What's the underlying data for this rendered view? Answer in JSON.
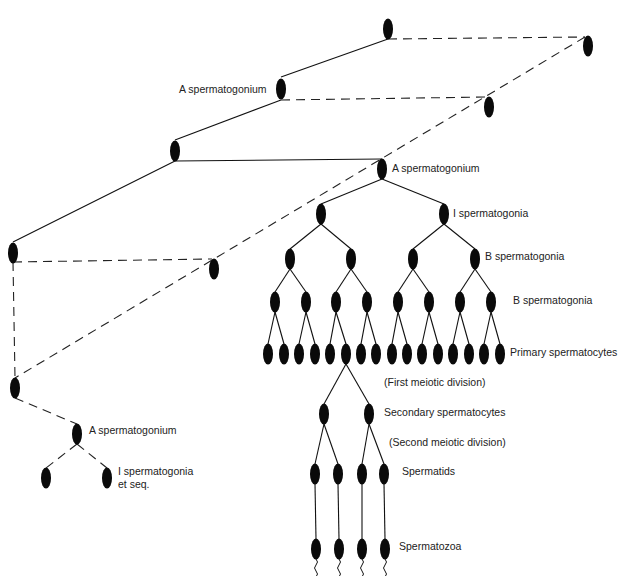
{
  "diagram": {
    "type": "cell-lineage-tree",
    "colors": {
      "background": "#ffffff",
      "ink": "#111111",
      "text": "#222222"
    },
    "labels": [
      {
        "id": "lbl-a-sperm-1",
        "text": "A spermatogonium",
        "x": 179,
        "y": 93
      },
      {
        "id": "lbl-a-sperm-2",
        "text": "A spermatogonium",
        "x": 392,
        "y": 172
      },
      {
        "id": "lbl-i-sperm",
        "text": "I spermatogonia",
        "x": 453,
        "y": 217
      },
      {
        "id": "lbl-b-sperm-1",
        "text": "B spermatogonia",
        "x": 485,
        "y": 260
      },
      {
        "id": "lbl-b-sperm-2",
        "text": "B spermatogonia",
        "x": 513,
        "y": 304
      },
      {
        "id": "lbl-primary",
        "text": "Primary spermatocytes",
        "x": 510,
        "y": 356
      },
      {
        "id": "lbl-first-meiotic",
        "text": "(First meiotic division)",
        "x": 384,
        "y": 386
      },
      {
        "id": "lbl-secondary",
        "text": "Secondary spermatocytes",
        "x": 384,
        "y": 416
      },
      {
        "id": "lbl-second-meiotic",
        "text": "(Second meiotic division)",
        "x": 389,
        "y": 446
      },
      {
        "id": "lbl-spermatids",
        "text": "Spermatids",
        "x": 402,
        "y": 475
      },
      {
        "id": "lbl-spermatozoa",
        "text": "Spermatozoa",
        "x": 399,
        "y": 550
      },
      {
        "id": "lbl-a-sperm-3",
        "text": "A spermatogonium",
        "x": 89,
        "y": 434
      },
      {
        "id": "lbl-i-sperm-etseq-1",
        "text": "I spermatogonia",
        "x": 118,
        "y": 475
      },
      {
        "id": "lbl-i-sperm-etseq-2",
        "text": "et seq.",
        "x": 118,
        "y": 488
      }
    ],
    "cells": [
      {
        "x": 388,
        "y": 29
      },
      {
        "x": 588,
        "y": 46
      },
      {
        "x": 281,
        "y": 89
      },
      {
        "x": 489,
        "y": 107
      },
      {
        "x": 175,
        "y": 151
      },
      {
        "x": 382,
        "y": 169
      },
      {
        "x": 13,
        "y": 253
      },
      {
        "x": 214,
        "y": 269
      },
      {
        "x": 321,
        "y": 214
      },
      {
        "x": 444,
        "y": 214
      },
      {
        "x": 290,
        "y": 259
      },
      {
        "x": 351,
        "y": 259
      },
      {
        "x": 413,
        "y": 259
      },
      {
        "x": 475,
        "y": 259
      },
      {
        "x": 275,
        "y": 302
      },
      {
        "x": 306,
        "y": 302
      },
      {
        "x": 336,
        "y": 302
      },
      {
        "x": 367,
        "y": 302
      },
      {
        "x": 398,
        "y": 302
      },
      {
        "x": 429,
        "y": 302
      },
      {
        "x": 460,
        "y": 302
      },
      {
        "x": 491,
        "y": 302
      },
      {
        "x": 268,
        "y": 354
      },
      {
        "x": 284,
        "y": 354
      },
      {
        "x": 299,
        "y": 354
      },
      {
        "x": 315,
        "y": 354
      },
      {
        "x": 330,
        "y": 354
      },
      {
        "x": 346,
        "y": 354
      },
      {
        "x": 361,
        "y": 354
      },
      {
        "x": 376,
        "y": 354
      },
      {
        "x": 392,
        "y": 354
      },
      {
        "x": 407,
        "y": 354
      },
      {
        "x": 422,
        "y": 354
      },
      {
        "x": 438,
        "y": 354
      },
      {
        "x": 453,
        "y": 354
      },
      {
        "x": 469,
        "y": 354
      },
      {
        "x": 484,
        "y": 354
      },
      {
        "x": 500,
        "y": 354
      },
      {
        "x": 324,
        "y": 414
      },
      {
        "x": 369,
        "y": 414
      },
      {
        "x": 315,
        "y": 474
      },
      {
        "x": 338,
        "y": 474
      },
      {
        "x": 362,
        "y": 474
      },
      {
        "x": 384,
        "y": 474
      },
      {
        "x": 316,
        "y": 549
      },
      {
        "x": 339,
        "y": 549
      },
      {
        "x": 362,
        "y": 549
      },
      {
        "x": 385,
        "y": 549
      },
      {
        "x": 15,
        "y": 388
      },
      {
        "x": 77,
        "y": 434
      },
      {
        "x": 46,
        "y": 478
      },
      {
        "x": 107,
        "y": 478
      }
    ],
    "solid_lines": [
      [
        388,
        39,
        281,
        77
      ],
      [
        281,
        100,
        175,
        140
      ],
      [
        175,
        161,
        13,
        242
      ],
      [
        175,
        161,
        382,
        159
      ],
      [
        382,
        179,
        321,
        204
      ],
      [
        382,
        179,
        444,
        204
      ],
      [
        321,
        224,
        290,
        249
      ],
      [
        321,
        224,
        351,
        249
      ],
      [
        444,
        224,
        413,
        249
      ],
      [
        444,
        224,
        475,
        249
      ],
      [
        290,
        269,
        275,
        292
      ],
      [
        290,
        269,
        306,
        292
      ],
      [
        351,
        269,
        336,
        292
      ],
      [
        351,
        269,
        367,
        292
      ],
      [
        413,
        269,
        398,
        292
      ],
      [
        413,
        269,
        429,
        292
      ],
      [
        475,
        269,
        460,
        292
      ],
      [
        475,
        269,
        491,
        292
      ],
      [
        275,
        312,
        268,
        344
      ],
      [
        275,
        312,
        284,
        344
      ],
      [
        306,
        312,
        299,
        344
      ],
      [
        306,
        312,
        315,
        344
      ],
      [
        336,
        312,
        330,
        344
      ],
      [
        336,
        312,
        346,
        344
      ],
      [
        367,
        312,
        361,
        344
      ],
      [
        367,
        312,
        376,
        344
      ],
      [
        398,
        312,
        392,
        344
      ],
      [
        398,
        312,
        407,
        344
      ],
      [
        429,
        312,
        422,
        344
      ],
      [
        429,
        312,
        438,
        344
      ],
      [
        460,
        312,
        453,
        344
      ],
      [
        460,
        312,
        469,
        344
      ],
      [
        491,
        312,
        484,
        344
      ],
      [
        491,
        312,
        500,
        344
      ],
      [
        346,
        364,
        324,
        404
      ],
      [
        346,
        364,
        369,
        404
      ],
      [
        324,
        424,
        315,
        464
      ],
      [
        324,
        424,
        338,
        464
      ],
      [
        369,
        424,
        362,
        464
      ],
      [
        369,
        424,
        384,
        464
      ],
      [
        315,
        484,
        316,
        539
      ],
      [
        338,
        484,
        339,
        539
      ],
      [
        362,
        484,
        362,
        539
      ],
      [
        384,
        484,
        385,
        539
      ]
    ],
    "dashed_lines": [
      [
        388,
        39,
        585,
        37
      ],
      [
        281,
        100,
        487,
        97
      ],
      [
        13,
        262,
        212,
        259
      ],
      [
        585,
        37,
        15,
        378
      ],
      [
        13,
        262,
        15,
        378
      ],
      [
        15,
        398,
        77,
        424
      ],
      [
        77,
        444,
        46,
        468
      ],
      [
        77,
        444,
        107,
        468
      ]
    ],
    "tails": [
      {
        "x": 316,
        "y": 559
      },
      {
        "x": 339,
        "y": 559
      },
      {
        "x": 362,
        "y": 559
      },
      {
        "x": 385,
        "y": 559
      }
    ]
  }
}
